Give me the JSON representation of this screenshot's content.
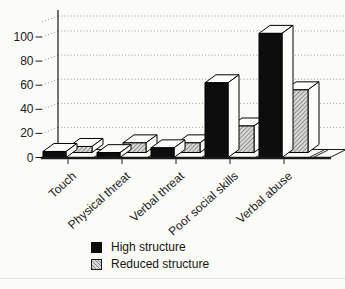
{
  "colors": {
    "black_bar": "#0d0d0d",
    "hatch_base": "#d8d8d4",
    "hatch_line": "#8a8a8a",
    "face_light": "#fdfdfb",
    "grid": "#9b9b9b",
    "axis": "#1a1a1a",
    "text": "#1a1a1a",
    "background": "#fbfbf8"
  },
  "chart_data": {
    "type": "bar",
    "projection": "pseudo-3d",
    "title": "",
    "xlabel": "",
    "ylabel": "",
    "categories": [
      "Touch",
      "Physical threat",
      "Verbal threat",
      "Poor social skills",
      "Verbal abuse"
    ],
    "series": [
      {
        "name": "High structure",
        "swatch": "solid-black",
        "values": [
          5,
          4,
          8,
          62,
          103
        ]
      },
      {
        "name": "Reduced structure",
        "swatch": "hatched-gray",
        "values": [
          5,
          8,
          8,
          22,
          52
        ]
      }
    ],
    "yticks": [
      0,
      20,
      40,
      60,
      80,
      100
    ],
    "ylim": [
      0,
      120
    ],
    "grid": "dotted-horizontal",
    "legend_position": "bottom-left"
  }
}
